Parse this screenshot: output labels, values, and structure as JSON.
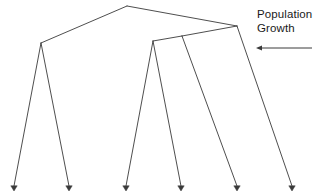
{
  "figure": {
    "name": "population-growth-phylogeny",
    "background_color": "#ffffff",
    "line_color": "#3a3a3a",
    "text_color": "#1a1a1a"
  },
  "annotation": {
    "line_1": "Population",
    "line_2": "Growth",
    "arrow_direction": "left",
    "arrow_icon": "arrow-left-icon",
    "arrow": {
      "x_start": 312,
      "x_end": 256,
      "y": 48
    }
  },
  "chart_data": {
    "type": "diagram",
    "subtype": "phylogenetic-tree",
    "title": "",
    "xlabel": "",
    "ylabel": "",
    "orientation": "top-root-down-tips",
    "xlim": [
      0,
      316
    ],
    "ylim": [
      0,
      194
    ],
    "grid": false,
    "legend": "none",
    "tip_marker": "arrowhead-down",
    "nodes": [
      {
        "id": "root",
        "x": 127,
        "y": 6,
        "kind": "internal"
      },
      {
        "id": "n_left",
        "x": 41,
        "y": 43,
        "kind": "internal"
      },
      {
        "id": "n_right",
        "x": 237,
        "y": 26,
        "kind": "internal"
      },
      {
        "id": "n_mid2",
        "x": 182,
        "y": 36,
        "kind": "internal"
      },
      {
        "id": "n_mid1",
        "x": 153,
        "y": 41,
        "kind": "internal"
      },
      {
        "id": "t1",
        "x": 14,
        "y": 186,
        "kind": "tip"
      },
      {
        "id": "t2",
        "x": 69,
        "y": 186,
        "kind": "tip"
      },
      {
        "id": "t3",
        "x": 126,
        "y": 186,
        "kind": "tip"
      },
      {
        "id": "t4",
        "x": 181,
        "y": 186,
        "kind": "tip"
      },
      {
        "id": "t5",
        "x": 237,
        "y": 186,
        "kind": "tip"
      },
      {
        "id": "t6",
        "x": 292,
        "y": 186,
        "kind": "tip"
      }
    ],
    "edges": [
      {
        "from": "root",
        "to": "n_left"
      },
      {
        "from": "root",
        "to": "n_right"
      },
      {
        "from": "n_left",
        "to": "t1"
      },
      {
        "from": "n_left",
        "to": "t2"
      },
      {
        "from": "n_right",
        "to": "n_mid2"
      },
      {
        "from": "n_right",
        "to": "t6"
      },
      {
        "from": "n_mid2",
        "to": "n_mid1"
      },
      {
        "from": "n_mid2",
        "to": "t5"
      },
      {
        "from": "n_mid1",
        "to": "t3"
      },
      {
        "from": "n_mid1",
        "to": "t4"
      }
    ]
  }
}
